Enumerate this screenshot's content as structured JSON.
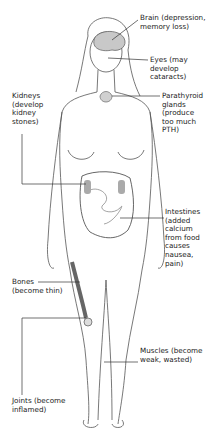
{
  "diagram": {
    "labels": [
      {
        "id": "brain",
        "text": "Brain (depression,\nmemory loss)"
      },
      {
        "id": "eyes",
        "text": "Eyes (may\ndevelop\ncataracts)"
      },
      {
        "id": "kidneys",
        "text": "Kidneys\n(develop\nkidney\nstones)"
      },
      {
        "id": "parathyroid",
        "text": "Parathyroid\nglands\n(produce\ntoo much\nPTH)"
      },
      {
        "id": "intestines",
        "text": "Intestines\n(added\ncalcium\nfrom food\ncauses\nnausea,\npain)"
      },
      {
        "id": "bones",
        "text": "Bones\n(become thin)"
      },
      {
        "id": "joints",
        "text": "Joints (become\ninflamed)"
      },
      {
        "id": "muscles",
        "text": "Muscles (become\nweak, wasted)"
      }
    ],
    "colors": {
      "line": "#333333",
      "organ_shade": "#b0b0b0",
      "text": "#222222"
    }
  }
}
